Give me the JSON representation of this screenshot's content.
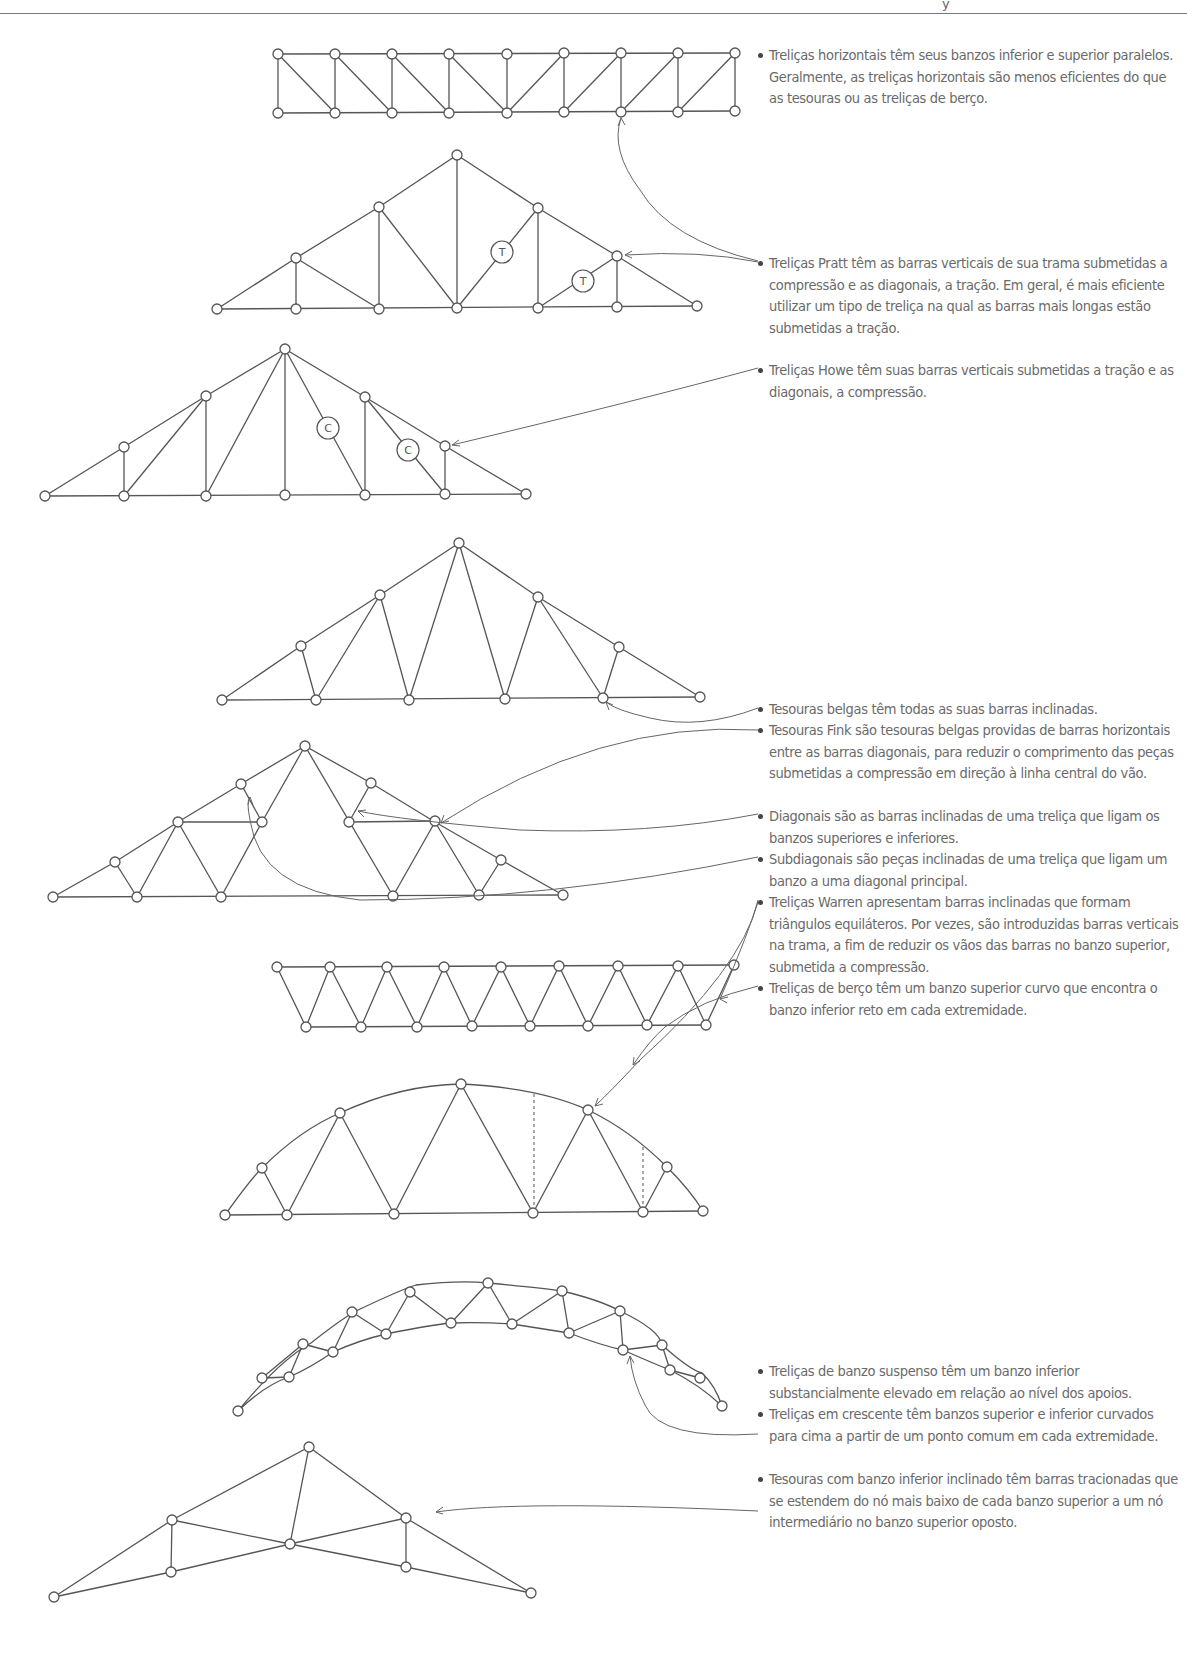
{
  "page": {
    "header_fragment": "y"
  },
  "notes": [
    {
      "id": "horizontal",
      "text": "Treliças horizontais têm seus banzos inferior e superior paralelos. Geralmente, as treliças horizontais são menos eficientes do que as tesouras ou as treliças de berço.",
      "top": 45
    },
    {
      "id": "pratt",
      "text": "Treliças Pratt têm as barras verticais de sua trama submetidas a compressão e as diagonais, a tração. Em geral, é mais eficiente utilizar um tipo de treliça na qual as barras mais longas estão submetidas a tração.",
      "top": 253
    },
    {
      "id": "howe",
      "text": "Treliças Howe têm suas barras verticais submetidas a tração e as diagonais, a compressão.",
      "top": 360
    },
    {
      "id": "belgian",
      "text": "Tesouras belgas têm todas as suas barras inclinadas.",
      "top": 699
    },
    {
      "id": "fink",
      "text": "Tesouras Fink são tesouras belgas providas de barras horizontais entre as barras diagonais, para reduzir o comprimento das peças submetidas a compressão em direção à linha central do vão.",
      "top": 720
    },
    {
      "id": "diagonals",
      "text": "Diagonais são as barras inclinadas de uma treliça que ligam os banzos superiores e inferiores.",
      "top": 806
    },
    {
      "id": "subdiagonals",
      "text": "Subdiagonais são peças inclinadas de uma treliça que ligam um banzo a uma diagonal principal.",
      "top": 849
    },
    {
      "id": "warren",
      "text": "Treliças Warren apresentam barras inclinadas que formam triângulos equiláteros. Por vezes, são introduzidas barras verticais na trama, a fim de reduzir os vãos das barras no banzo superior, submetida a compressão.",
      "top": 892
    },
    {
      "id": "bowstring",
      "text": "Treliças de berço têm um banzo superior curvo que encontra o banzo inferior reto em cada extremidade.",
      "top": 978
    },
    {
      "id": "raised-chord",
      "text": "Treliças de banzo suspenso têm um banzo inferior substancialmente elevado em relação ao nível dos apoios.",
      "top": 1361
    },
    {
      "id": "crescent",
      "text": "Treliças em crescente têm banzos superior e inferior curvados para cima a partir de um ponto comum em cada extremidade.",
      "top": 1404
    },
    {
      "id": "scissors",
      "text": "Tesouras com banzo inferior inclinado têm barras tracionadas que se estendem do nó mais baixo de cada banzo superior a um nó intermediário no banzo superior oposto.",
      "top": 1469
    }
  ],
  "diagrams": {
    "pratt_tags": [
      "T",
      "T"
    ],
    "howe_tags": [
      "C",
      "C"
    ]
  },
  "colors": {
    "ink": "#555555",
    "text": "#6a6a6a",
    "background": "#ffffff"
  }
}
